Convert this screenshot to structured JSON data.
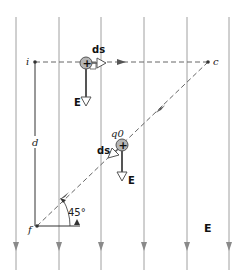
{
  "figure": {
    "field_label": "E",
    "points": {
      "i": {
        "label": "i",
        "x": 35,
        "y": 62
      },
      "c": {
        "label": "c",
        "x": 208,
        "y": 62
      },
      "f": {
        "label": "f",
        "x": 37,
        "y": 226
      }
    },
    "distance_label": "d",
    "angle_label": "45°",
    "charge_top": {
      "sign": "+",
      "displacement_label": "ds",
      "field_label": "E"
    },
    "charge_diagonal": {
      "sign": "+",
      "charge_label": "q0",
      "displacement_label": "ds",
      "field_label": "E"
    },
    "field_line_count": 6,
    "colors": {
      "field_line": "#9a9a9a",
      "path_dashed": "#777777",
      "charge_fill": "#b5b5b5",
      "charge_stroke": "#555555",
      "text": "#111111"
    }
  }
}
